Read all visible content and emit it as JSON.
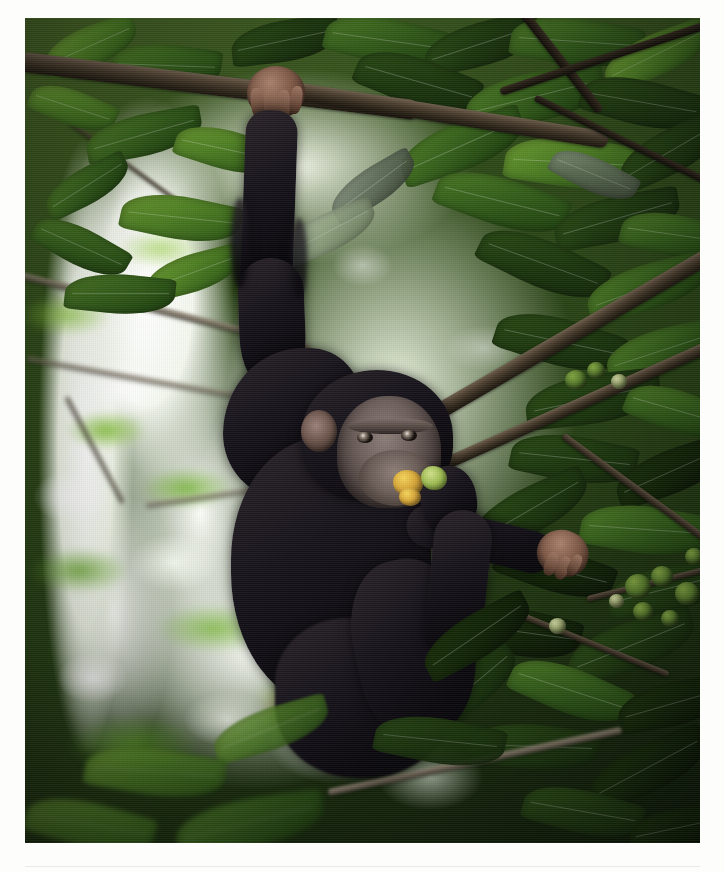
{
  "page": {
    "background_color": "#ffffff",
    "rule_color": "#eceae6",
    "margins": {
      "left": 25,
      "top": 18,
      "right": 24,
      "bottom": 29
    }
  },
  "photo": {
    "name": "chimpanzee-in-fig-tree",
    "alt_text": "A chimpanzee hangs one-armed from a tree branch in dense green forest canopy while eating a ripe fig held in its other hand",
    "width": 675,
    "height": 825,
    "orientation": "portrait",
    "focus": "sharp subject, blurred bokeh background",
    "colors": {
      "canopy_green_light": "#6d9c31",
      "canopy_green_mid": "#35601a",
      "canopy_green_dark": "#16280b",
      "sky_highlight": "#ffffff",
      "branch_brown": "#4a3d2e",
      "fur_black": "#15121a",
      "skin_face": "#6d5f5b",
      "hand_skin": "#7d5745",
      "fig_ripe_yellow": "#d9a83a",
      "fig_green": "#6d8a32"
    },
    "subject": {
      "species": "chimpanzee",
      "pose": "suspended by one arm from overhead branch",
      "activity": "feeding on fig fruit",
      "parts": [
        {
          "label": "gripping-hand",
          "position": "top-center"
        },
        {
          "label": "extended-arm",
          "position": "upper-center"
        },
        {
          "label": "head-and-face",
          "position": "center"
        },
        {
          "label": "feeding-hand",
          "position": "center-right"
        },
        {
          "label": "torso",
          "position": "lower-center"
        },
        {
          "label": "lower-limb",
          "position": "center-right-reaching-branch"
        }
      ]
    },
    "scene_elements": [
      {
        "label": "overhead-branch",
        "description": "thick horizontal branch gripped by the chimpanzee"
      },
      {
        "label": "diagonal-branch",
        "description": "large branch crossing from lower-left to upper-right"
      },
      {
        "label": "fig-cluster",
        "description": "cluster of round green figs on a branch at right"
      },
      {
        "label": "canopy-leaves",
        "description": "broad elliptical fig-tree leaves filling the frame"
      },
      {
        "label": "sky-gaps",
        "description": "bright white backlit openings in the canopy"
      },
      {
        "label": "forest-floor-bokeh",
        "description": "blurred green and white understorey at the bottom"
      }
    ]
  }
}
